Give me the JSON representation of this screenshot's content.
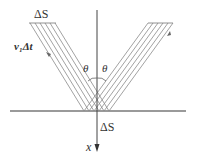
{
  "diagram": {
    "type": "wave-reflection",
    "labels": {
      "incident_width": "ΔS",
      "incident_path": "v₁Δt",
      "angle_left": "θ",
      "angle_right": "θ",
      "surface_width": "ΔS",
      "axis": "x"
    },
    "colors": {
      "lines": "#8a8a8a",
      "surface": "#9a9a9a",
      "axis": "#444444",
      "text": "#333333"
    },
    "incident_beam": {
      "ray_count": 6,
      "direction": "down-right"
    },
    "reflected_beam": {
      "ray_count": 6,
      "direction": "up-right"
    }
  }
}
